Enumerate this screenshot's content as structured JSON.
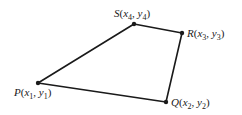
{
  "diagram": {
    "type": "quadrilateral",
    "edges": [
      [
        "P",
        "Q"
      ],
      [
        "Q",
        "R"
      ],
      [
        "R",
        "S"
      ],
      [
        "S",
        "P"
      ]
    ],
    "vertices": [
      {
        "id": "P",
        "letter": "P",
        "sub": "1",
        "x": 38,
        "y": 83,
        "lx": 14,
        "ly": 96
      },
      {
        "id": "Q",
        "letter": "Q",
        "sub": "2",
        "x": 166,
        "y": 102,
        "lx": 171,
        "ly": 106
      },
      {
        "id": "R",
        "letter": "R",
        "sub": "3",
        "x": 182,
        "y": 33,
        "lx": 187,
        "ly": 37
      },
      {
        "id": "S",
        "letter": "S",
        "sub": "4",
        "x": 134,
        "y": 24,
        "lx": 114,
        "ly": 17
      }
    ],
    "labels": {
      "P": {
        "letter": "P",
        "open": "(",
        "x": "x",
        "xsub": "1",
        "comma": ", ",
        "y": "y",
        "ysub": "1",
        "close": ")"
      },
      "Q": {
        "letter": "Q",
        "open": "(",
        "x": "x",
        "xsub": "2",
        "comma": ", ",
        "y": "y",
        "ysub": "2",
        "close": ")"
      },
      "R": {
        "letter": "R",
        "open": "(",
        "x": "x",
        "xsub": "3",
        "comma": ", ",
        "y": "y",
        "ysub": "3",
        "close": ")"
      },
      "S": {
        "letter": "S",
        "open": "(",
        "x": "x",
        "xsub": "4",
        "comma": ", ",
        "y": "y",
        "ysub": "4",
        "close": ")"
      }
    },
    "colors": {
      "stroke": "#1a1a1a",
      "background": "#ffffff"
    }
  }
}
